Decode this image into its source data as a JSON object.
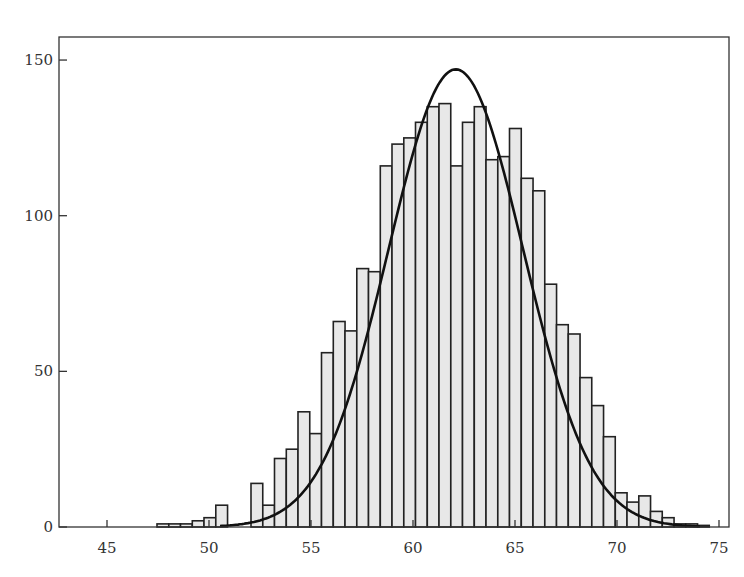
{
  "chart_data": {
    "type": "bar",
    "title": "",
    "xlabel": "",
    "ylabel": "",
    "xlim": [
      43,
      76
    ],
    "ylim": [
      0,
      160
    ],
    "grid": false,
    "legend": null,
    "x_ticks": [
      45,
      50,
      55,
      60,
      65,
      70,
      75
    ],
    "y_ticks": [
      0,
      50,
      100,
      150
    ],
    "bin_width": 0.5,
    "bins": [
      {
        "x0": 47.5,
        "count": 1
      },
      {
        "x0": 48.0,
        "count": 1
      },
      {
        "x0": 48.5,
        "count": 1
      },
      {
        "x0": 49.0,
        "count": 2
      },
      {
        "x0": 49.5,
        "count": 3
      },
      {
        "x0": 50.0,
        "count": 7
      },
      {
        "x0": 51.5,
        "count": 14
      },
      {
        "x0": 52.0,
        "count": 7
      },
      {
        "x0": 52.5,
        "count": 22
      },
      {
        "x0": 53.0,
        "count": 25
      },
      {
        "x0": 53.5,
        "count": 37
      },
      {
        "x0": 54.0,
        "count": 30
      },
      {
        "x0": 54.5,
        "count": 56
      },
      {
        "x0": 55.0,
        "count": 66
      },
      {
        "x0": 55.5,
        "count": 63
      },
      {
        "x0": 56.0,
        "count": 83
      },
      {
        "x0": 56.5,
        "count": 82
      },
      {
        "x0": 57.0,
        "count": 116
      },
      {
        "x0": 57.5,
        "count": 123
      },
      {
        "x0": 58.0,
        "count": 125
      },
      {
        "x0": 58.5,
        "count": 130
      },
      {
        "x0": 59.0,
        "count": 135
      },
      {
        "x0": 59.5,
        "count": 136
      },
      {
        "x0": 60.0,
        "count": 116
      },
      {
        "x0": 60.5,
        "count": 130
      },
      {
        "x0": 61.0,
        "count": 135
      },
      {
        "x0": 61.5,
        "count": 118
      },
      {
        "x0": 62.0,
        "count": 119
      },
      {
        "x0": 62.5,
        "count": 128
      },
      {
        "x0": 63.0,
        "count": 112
      },
      {
        "x0": 63.5,
        "count": 108
      },
      {
        "x0": 64.0,
        "count": 78
      },
      {
        "x0": 64.5,
        "count": 65
      },
      {
        "x0": 65.0,
        "count": 62
      },
      {
        "x0": 65.5,
        "count": 48
      },
      {
        "x0": 66.0,
        "count": 39
      },
      {
        "x0": 66.5,
        "count": 29
      },
      {
        "x0": 67.0,
        "count": 11
      },
      {
        "x0": 67.5,
        "count": 8
      },
      {
        "x0": 68.0,
        "count": 10
      },
      {
        "x0": 68.5,
        "count": 5
      },
      {
        "x0": 69.0,
        "count": 3
      },
      {
        "x0": 69.5,
        "count": 1
      },
      {
        "x0": 70.0,
        "count": 1
      },
      {
        "x0": 70.5,
        "count": 0.5
      }
    ],
    "overlay_curve": {
      "type": "normal_pdf_scaled",
      "mean": 62.1,
      "peak": 147,
      "sd": 3.3,
      "x_range": [
        51,
        74.5
      ]
    },
    "colors": {
      "bar_fill": "#e8e8e8",
      "bar_edge": "#222222",
      "curve": "#111111",
      "frame": "#333333"
    }
  }
}
